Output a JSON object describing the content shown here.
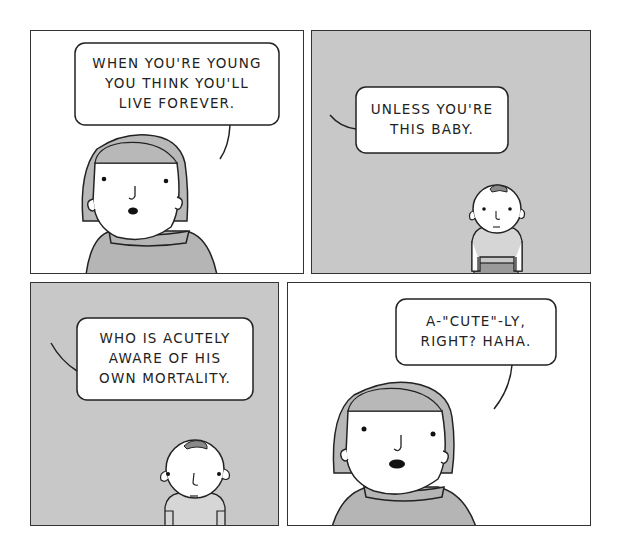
{
  "comic": {
    "colors": {
      "panel_white": "#ffffff",
      "panel_gray": "#c8c8c8",
      "hair_gray": "#b8b8b8",
      "sweater_gray": "#b5b5b5",
      "baby_hair": "#8a8a8a",
      "baby_shirt": "#d6d6d6",
      "baby_pants": "#9a9a9a",
      "ink": "#222222"
    },
    "panels": [
      {
        "id": 1,
        "background": "white",
        "speaker": "woman",
        "text_lines": [
          "WHEN YOU'RE YOUNG",
          "YOU THINK YOU'LL",
          "LIVE FOREVER."
        ]
      },
      {
        "id": 2,
        "background": "gray",
        "speaker": "off-panel",
        "text_lines": [
          "UNLESS YOU'RE",
          "THIS BABY."
        ]
      },
      {
        "id": 3,
        "background": "gray",
        "speaker": "off-panel",
        "text_lines": [
          "WHO IS ACUTELY",
          "AWARE OF HIS",
          "OWN MORTALITY."
        ]
      },
      {
        "id": 4,
        "background": "white",
        "speaker": "woman",
        "text_lines": [
          "A-\"CUTE\"-LY,",
          "RIGHT? HAHA."
        ]
      }
    ]
  }
}
